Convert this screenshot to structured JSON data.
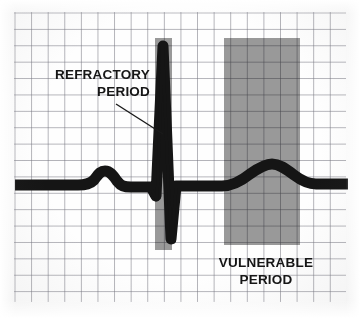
{
  "figure": {
    "kind": "ecg-strip-diagram",
    "background_color": "#fdfdfd",
    "grid": {
      "line_color": "#76768c",
      "cell_px": 16.5,
      "left": 14,
      "top": 12,
      "width": 332,
      "height": 290
    },
    "trace": {
      "color": "#151515",
      "baseline_y": 185,
      "start_x": 15,
      "end_x": 348,
      "stroke_px": 11
    }
  },
  "bands": [
    {
      "id": "refractory-band",
      "name": "refractory-period-band",
      "color": "#9a9a9a",
      "x": 155,
      "y": 38,
      "width": 17,
      "height": 212
    },
    {
      "id": "vulnerable-band",
      "name": "vulnerable-period-band",
      "color": "#9a9a9a",
      "x": 224,
      "y": 38,
      "width": 76,
      "height": 207
    }
  ],
  "annotations": {
    "refractory": {
      "line1": "REFRACTORY",
      "line2": "PERIOD",
      "text": "REFRACTORY\nPERIOD",
      "leader_line": {
        "x1": 116,
        "y1": 104,
        "x2": 163,
        "y2": 134,
        "color": "#1a1a1a"
      }
    },
    "vulnerable": {
      "line1": "VULNERABLE",
      "line2": "PERIOD",
      "text": "VULNERABLE\nPERIOD"
    }
  },
  "waveform": {
    "description": "Single ECG cycle: flat baseline, P wave, narrow QRS complex with tall R spike and deep S wave, broad T wave.",
    "features": [
      {
        "name": "baseline-left",
        "x_start": 15,
        "x_end": 78,
        "y": 185
      },
      {
        "name": "p-wave-peak",
        "x": 105,
        "y": 172
      },
      {
        "name": "pr-segment",
        "x_start": 122,
        "x_end": 150,
        "y": 186
      },
      {
        "name": "q-dip",
        "x": 157,
        "y": 199
      },
      {
        "name": "r-wave-peak",
        "x": 163,
        "y": 45
      },
      {
        "name": "s-wave-trough",
        "x": 172,
        "y": 241
      },
      {
        "name": "st-segment",
        "x_start": 178,
        "x_end": 222,
        "y": 185
      },
      {
        "name": "t-wave-peak",
        "x": 272,
        "y": 166
      },
      {
        "name": "baseline-right",
        "x_start": 310,
        "x_end": 348,
        "y": 185
      }
    ]
  }
}
